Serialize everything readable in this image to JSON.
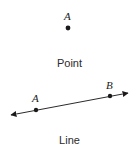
{
  "figure": {
    "title": "",
    "background_color": "#ffffff",
    "stroke_color": "#1a1a1a",
    "text_color": "#2b2b2b"
  },
  "point_diagram": {
    "caption": "Point",
    "label": "A",
    "dot": {
      "x": 68,
      "y": 28,
      "r": 2.4
    }
  },
  "line_diagram": {
    "caption": "Line",
    "labels": {
      "a": "A",
      "b": "B"
    },
    "line": {
      "x1": 11,
      "y1": 115,
      "x2": 128,
      "y2": 93
    },
    "points": [
      {
        "name": "A",
        "x": 36,
        "y": 110,
        "r": 2.2
      },
      {
        "name": "B",
        "x": 110,
        "y": 96,
        "r": 2.2
      }
    ],
    "arrowheads": [
      "start",
      "end"
    ]
  }
}
